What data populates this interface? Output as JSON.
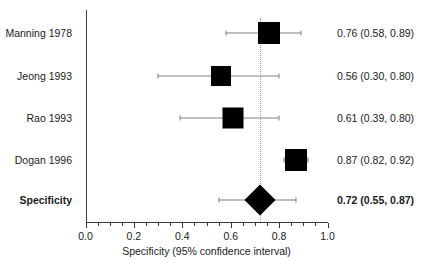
{
  "chart_data": {
    "type": "forest",
    "title": "",
    "xlabel": "Specificity (95% confidence interval)",
    "ylabel": "",
    "xlim": [
      0.0,
      1.0
    ],
    "xticks": [
      "0.0",
      "0.2",
      "0.4",
      "0.6",
      "0.8",
      "1.0"
    ],
    "xtick_values": [
      0.0,
      0.2,
      0.4,
      0.6,
      0.8,
      1.0
    ],
    "minor_tick_step": 0.05,
    "grid": false,
    "legend": "none",
    "reference_line": 0.72,
    "effect_measure": "Specificity",
    "studies": [
      {
        "label": "Manning 1978",
        "estimate": 0.76,
        "ci_low": 0.58,
        "ci_high": 0.89,
        "value_text": "0.76 (0.58, 0.89)",
        "marker": "square",
        "weight": 1.0,
        "summary": false
      },
      {
        "label": "Jeong 1993",
        "estimate": 0.56,
        "ci_low": 0.3,
        "ci_high": 0.8,
        "value_text": "0.56 (0.30, 0.80)",
        "marker": "square",
        "weight": 0.75,
        "summary": false
      },
      {
        "label": "Rao 1993",
        "estimate": 0.61,
        "ci_low": 0.39,
        "ci_high": 0.8,
        "value_text": "0.61 (0.39, 0.80)",
        "marker": "square",
        "weight": 0.86,
        "summary": false
      },
      {
        "label": "Dogan 1996",
        "estimate": 0.87,
        "ci_low": 0.82,
        "ci_high": 0.92,
        "value_text": "0.87 (0.82, 0.92)",
        "marker": "square",
        "weight": 1.0,
        "summary": false
      },
      {
        "label": "Specificity",
        "estimate": 0.72,
        "ci_low": 0.55,
        "ci_high": 0.87,
        "value_text": "0.72 (0.55, 0.87)",
        "marker": "diamond",
        "weight": 1.0,
        "summary": true
      }
    ]
  },
  "colors": {
    "marker": "#000000",
    "ci_line": "#808080",
    "axis": "#3a3a3a",
    "reference_line": "#9a9a9a",
    "text": "#1a1a1a",
    "background": "#ffffff"
  }
}
